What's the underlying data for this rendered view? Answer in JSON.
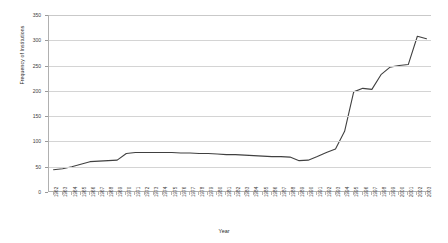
{
  "chart_data": {
    "type": "line",
    "title": "",
    "xlabel": "Year",
    "ylabel": "Frequency of Institutions",
    "xlim": [
      1962,
      2003
    ],
    "ylim": [
      0,
      350
    ],
    "yticks": [
      0,
      50,
      100,
      150,
      200,
      250,
      300,
      350
    ],
    "grid": true,
    "legend": false,
    "line_color": "#404040",
    "categories": [
      "1962",
      "1963",
      "1964",
      "1965",
      "1966",
      "1967",
      "1968",
      "1969",
      "1970",
      "1971",
      "1972",
      "1973",
      "1974",
      "1975",
      "1976",
      "1977",
      "1978",
      "1979",
      "1980",
      "1981",
      "1982",
      "1983",
      "1984",
      "1985",
      "1986",
      "1987",
      "1988",
      "1989",
      "1990",
      "1991",
      "1992",
      "1993",
      "1994",
      "1995",
      "1996",
      "1997",
      "1998",
      "1999",
      "2000",
      "2001",
      "2002",
      "2003"
    ],
    "values": [
      44,
      46,
      50,
      55,
      60,
      61,
      62,
      63,
      76,
      78,
      78,
      78,
      78,
      78,
      77,
      77,
      76,
      76,
      75,
      74,
      74,
      73,
      72,
      71,
      70,
      70,
      69,
      62,
      63,
      70,
      78,
      85,
      120,
      198,
      205,
      203,
      232,
      247,
      250,
      252,
      308,
      303
    ]
  },
  "axes": {
    "y_title": "Frequency of Institutions",
    "x_title": "Year"
  }
}
